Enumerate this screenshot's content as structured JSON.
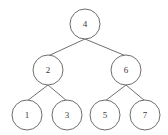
{
  "diagram": {
    "type": "binary-search-tree",
    "background_color": "#ffffff",
    "stroke_color": "#6e6e6c",
    "label_color": "#3b3b3b",
    "node_radius": 15,
    "leaf_radius": 15,
    "nodes": [
      {
        "id": "root",
        "label": "4",
        "cx": 85,
        "cy": 24,
        "r": 15,
        "level": 0
      },
      {
        "id": "left",
        "label": "2",
        "cx": 48,
        "cy": 70,
        "r": 15,
        "level": 1
      },
      {
        "id": "right",
        "label": "6",
        "cx": 126,
        "cy": 70,
        "r": 15,
        "level": 1
      },
      {
        "id": "ll",
        "label": "1",
        "cx": 27,
        "cy": 115,
        "r": 15,
        "level": 2
      },
      {
        "id": "lr",
        "label": "3",
        "cx": 67,
        "cy": 115,
        "r": 15,
        "level": 2
      },
      {
        "id": "rl",
        "label": "5",
        "cx": 105,
        "cy": 115,
        "r": 15,
        "level": 2
      },
      {
        "id": "rr",
        "label": "7",
        "cx": 145,
        "cy": 115,
        "r": 15,
        "level": 2
      }
    ],
    "edges": [
      {
        "id": "edge-root-left",
        "from": "root",
        "to": "left",
        "x1": 85,
        "y1": 39,
        "x2": 48,
        "y2": 56
      },
      {
        "id": "edge-root-right",
        "from": "root",
        "to": "right",
        "x1": 85,
        "y1": 39,
        "x2": 126,
        "y2": 56
      },
      {
        "id": "edge-left-ll",
        "from": "left",
        "to": "ll",
        "x1": 48,
        "y1": 85,
        "x2": 27,
        "y2": 101
      },
      {
        "id": "edge-left-lr",
        "from": "left",
        "to": "lr",
        "x1": 48,
        "y1": 85,
        "x2": 67,
        "y2": 101
      },
      {
        "id": "edge-right-rl",
        "from": "right",
        "to": "rl",
        "x1": 126,
        "y1": 85,
        "x2": 105,
        "y2": 101
      },
      {
        "id": "edge-right-rr",
        "from": "right",
        "to": "rr",
        "x1": 126,
        "y1": 85,
        "x2": 145,
        "y2": 101
      }
    ]
  }
}
